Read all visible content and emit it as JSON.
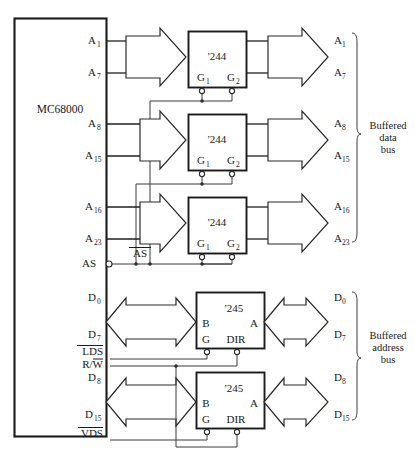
{
  "figure": {
    "caption": ""
  },
  "cpu": {
    "name": "MC68000",
    "pins": [
      {
        "id": "a1",
        "label": "A",
        "sub": "1"
      },
      {
        "id": "a7",
        "label": "A",
        "sub": "7"
      },
      {
        "id": "a8",
        "label": "A",
        "sub": "8"
      },
      {
        "id": "a15",
        "label": "A",
        "sub": "15"
      },
      {
        "id": "a16",
        "label": "A",
        "sub": "16"
      },
      {
        "id": "a23",
        "label": "A",
        "sub": "23"
      },
      {
        "id": "as",
        "label": "AS",
        "sub": ""
      },
      {
        "id": "d0",
        "label": "D",
        "sub": "0"
      },
      {
        "id": "d7",
        "label": "D",
        "sub": "7"
      },
      {
        "id": "lds",
        "label": "LDS",
        "sub": ""
      },
      {
        "id": "rw",
        "label": "R/W",
        "sub": ""
      },
      {
        "id": "d8",
        "label": "D",
        "sub": "8"
      },
      {
        "id": "d15",
        "label": "D",
        "sub": "15"
      },
      {
        "id": "vds",
        "label": "VDS",
        "sub": ""
      }
    ]
  },
  "control_signals": {
    "as_external": "AS",
    "lds": "LDS",
    "rw": "R/W",
    "vds": "VDS"
  },
  "chips": [
    {
      "id": "u1",
      "part": "'244",
      "pin_left": "G",
      "pin_left_sub": "1",
      "pin_right": "G",
      "pin_right_sub": "2",
      "in_top": "A1",
      "in_bottom": "A7"
    },
    {
      "id": "u2",
      "part": "'244",
      "pin_left": "G",
      "pin_left_sub": "1",
      "pin_right": "G",
      "pin_right_sub": "2",
      "in_top": "A8",
      "in_bottom": "A15"
    },
    {
      "id": "u3",
      "part": "'244",
      "pin_left": "G",
      "pin_left_sub": "1",
      "pin_right": "G",
      "pin_right_sub": "2",
      "in_top": "A16",
      "in_bottom": "A23"
    },
    {
      "id": "u4",
      "part": "'245",
      "pin_b": "B",
      "pin_a": "A",
      "pin_g": "G",
      "pin_dir": "DIR",
      "in_top": "D0",
      "in_bottom": "D7"
    },
    {
      "id": "u5",
      "part": "'245",
      "pin_b": "B",
      "pin_a": "A",
      "pin_g": "G",
      "pin_dir": "DIR",
      "in_top": "D8",
      "in_bottom": "D15"
    }
  ],
  "outputs": [
    {
      "id": "o_a1",
      "label": "A",
      "sub": "1"
    },
    {
      "id": "o_a7",
      "label": "A",
      "sub": "7"
    },
    {
      "id": "o_a8",
      "label": "A",
      "sub": "8"
    },
    {
      "id": "o_a15",
      "label": "A",
      "sub": "15"
    },
    {
      "id": "o_a16",
      "label": "A",
      "sub": "16"
    },
    {
      "id": "o_a23",
      "label": "A",
      "sub": "23"
    },
    {
      "id": "o_d0",
      "label": "D",
      "sub": "0"
    },
    {
      "id": "o_d7",
      "label": "D",
      "sub": "7"
    },
    {
      "id": "o_d8",
      "label": "D",
      "sub": "8"
    },
    {
      "id": "o_d15",
      "label": "D",
      "sub": "15"
    }
  ],
  "bus_groups": [
    {
      "id": "upper",
      "line1": "Buffered",
      "line2": "data",
      "line3": "bus"
    },
    {
      "id": "lower",
      "line1": "Buffered",
      "line2": "address",
      "line3": "bus"
    }
  ],
  "colors": {
    "ink": "#1a1a1a",
    "wire": "#3b3b3b",
    "paper": "#ffffff"
  }
}
